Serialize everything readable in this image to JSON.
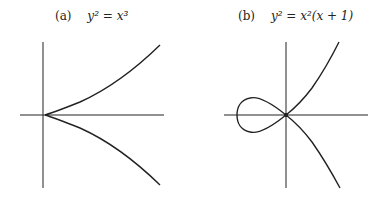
{
  "panels": [
    {
      "tag": "(a)",
      "equation_html": "y² = x³",
      "curve_name": "cusp"
    },
    {
      "tag": "(b)",
      "equation_html": "y² = x²(x + 1)",
      "curve_name": "node"
    }
  ],
  "colors": {
    "stroke": "#222222",
    "background": "#ffffff"
  }
}
